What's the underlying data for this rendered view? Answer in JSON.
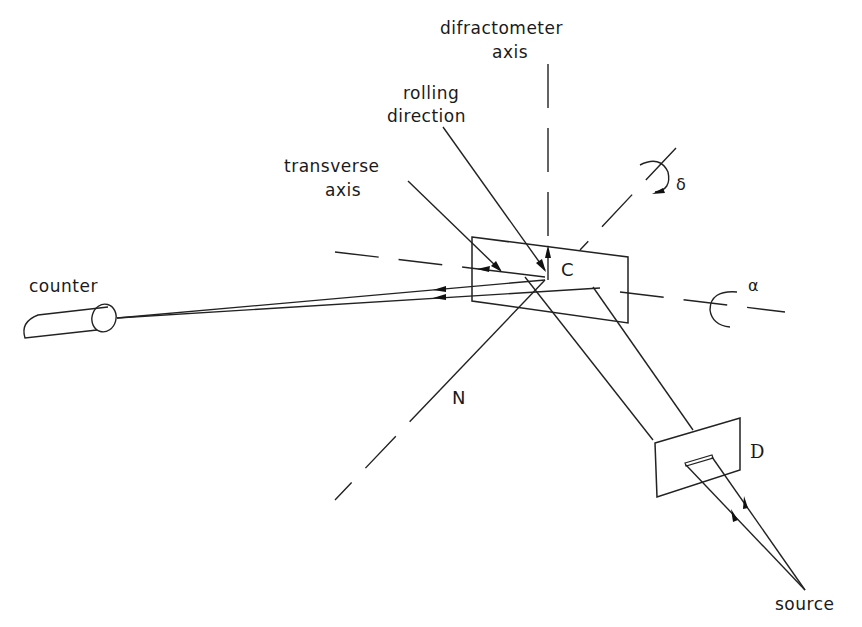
{
  "diagram": {
    "type": "x-ray texture goniometer geometry",
    "stroke_color": "#222222",
    "background": "#ffffff"
  },
  "labels": {
    "difractometer_axis_line1": "difractometer",
    "difractometer_axis_line2": "axis",
    "rolling_direction_line1": "rolling",
    "rolling_direction_line2": "direction",
    "transverse_axis_line1": "transverse",
    "transverse_axis_line2": "axis",
    "counter": "counter",
    "crystal": "C",
    "normal": "N",
    "slit": "D",
    "source": "source",
    "delta": "δ",
    "alpha": "α"
  },
  "nodes": {
    "crystal_center": [
      545,
      280
    ],
    "source_point": [
      805,
      590
    ],
    "counter_window": [
      117,
      318
    ]
  }
}
